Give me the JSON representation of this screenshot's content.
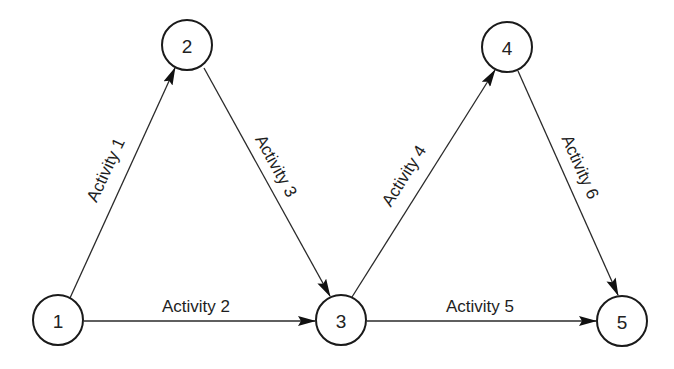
{
  "diagram": {
    "type": "activity-on-arrow network",
    "colors": {
      "background": "#ffffff",
      "stroke": "#1a1a1a",
      "text": "#222222"
    },
    "nodes": [
      {
        "id": "1",
        "label": "1",
        "x": 58,
        "y": 320
      },
      {
        "id": "2",
        "label": "2",
        "x": 187,
        "y": 45
      },
      {
        "id": "3",
        "label": "3",
        "x": 341,
        "y": 320
      },
      {
        "id": "4",
        "label": "4",
        "x": 507,
        "y": 47
      },
      {
        "id": "5",
        "label": "5",
        "x": 622,
        "y": 321
      }
    ],
    "edges": [
      {
        "id": "a1",
        "from": "1",
        "to": "2",
        "label": "Activity 1"
      },
      {
        "id": "a2",
        "from": "1",
        "to": "3",
        "label": "Activity 2"
      },
      {
        "id": "a3",
        "from": "2",
        "to": "3",
        "label": "Activity 3"
      },
      {
        "id": "a4",
        "from": "3",
        "to": "4",
        "label": "Activity 4"
      },
      {
        "id": "a5",
        "from": "3",
        "to": "5",
        "label": "Activity 5"
      },
      {
        "id": "a6",
        "from": "4",
        "to": "5",
        "label": "Activity 6"
      }
    ]
  }
}
